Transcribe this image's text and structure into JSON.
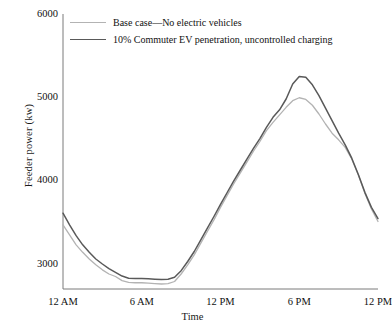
{
  "chart_data": {
    "type": "line",
    "title": "",
    "xlabel": "Time",
    "ylabel": "Feeder power (kw)",
    "xlim": [
      0,
      24
    ],
    "ylim": [
      2700,
      6000
    ],
    "grid": false,
    "legend_position": "top-left",
    "yticks": [
      3000,
      4000,
      5000,
      6000
    ],
    "ytick_labels": [
      "3000",
      "4000",
      "5000",
      "6000"
    ],
    "xticks": [
      0,
      6,
      12,
      18,
      24
    ],
    "xtick_labels": [
      "12 AM",
      "6 AM",
      "12 PM",
      "6 PM",
      "12 PM"
    ],
    "x": [
      0,
      0.5,
      1,
      1.5,
      2,
      2.5,
      3,
      3.5,
      4,
      4.5,
      5,
      5.5,
      6,
      6.5,
      7,
      7.5,
      8,
      8.5,
      9,
      9.5,
      10,
      10.5,
      11,
      11.5,
      12,
      12.5,
      13,
      13.5,
      14,
      14.5,
      15,
      15.5,
      16,
      16.5,
      17,
      17.5,
      18,
      18.5,
      19,
      19.5,
      20,
      20.5,
      21,
      21.5,
      22,
      22.5,
      23,
      23.5,
      24
    ],
    "series": [
      {
        "name": "Base case—No electric vehicles",
        "color": "#b3b3b3",
        "width": 1.3,
        "values": [
          3470,
          3350,
          3230,
          3140,
          3060,
          2990,
          2930,
          2880,
          2850,
          2800,
          2780,
          2775,
          2775,
          2770,
          2765,
          2760,
          2765,
          2790,
          2880,
          2990,
          3110,
          3250,
          3390,
          3530,
          3680,
          3820,
          3960,
          4090,
          4220,
          4350,
          4470,
          4600,
          4700,
          4790,
          4880,
          4960,
          4995,
          4975,
          4905,
          4800,
          4680,
          4570,
          4490,
          4400,
          4260,
          4070,
          3850,
          3660,
          3510
        ]
      },
      {
        "name": "10% Commuter EV penetration, uncontrolled charging",
        "color": "#595959",
        "width": 1.5,
        "values": [
          3610,
          3470,
          3340,
          3230,
          3140,
          3060,
          3000,
          2945,
          2900,
          2855,
          2830,
          2825,
          2825,
          2822,
          2818,
          2815,
          2818,
          2840,
          2920,
          3030,
          3150,
          3290,
          3430,
          3570,
          3715,
          3855,
          3995,
          4125,
          4255,
          4385,
          4505,
          4640,
          4760,
          4850,
          4980,
          5160,
          5250,
          5240,
          5150,
          5020,
          4870,
          4720,
          4570,
          4430,
          4270,
          4075,
          3860,
          3680,
          3545
        ]
      }
    ]
  },
  "axes": {
    "y_title": "Feeder power (kw)",
    "x_title": "Time"
  }
}
